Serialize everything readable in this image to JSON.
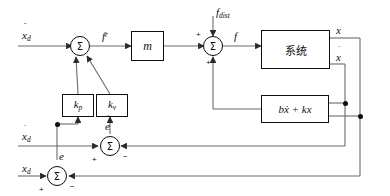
{
  "diagram": {
    "canvas": {
      "width": 390,
      "height": 196
    },
    "line_color": "#4a4a4a",
    "stroke_color": "#0d0d0d",
    "background": "#ffffff"
  },
  "inputs": {
    "accel_ref": {
      "base": "x",
      "accent": "¨",
      "sub": "d",
      "text": "ẍd"
    },
    "vel_ref": {
      "base": "x",
      "accent": "˙",
      "sub": "d",
      "text": "ẋd"
    },
    "pos_ref": {
      "base": "x",
      "sub": "d",
      "text": "xd"
    },
    "disturbance": {
      "base": "f",
      "sub": "dist",
      "text": "fdist"
    }
  },
  "signals": {
    "command_force": {
      "base": "f",
      "sup": "r",
      "text": "f r"
    },
    "total_force": {
      "base": "f",
      "text": "f"
    },
    "position_out": {
      "base": "x",
      "text": "x"
    },
    "velocity_out": {
      "base": "x",
      "accent": "˙",
      "text": "ẋ"
    },
    "pos_error": {
      "base": "e",
      "text": "e"
    },
    "vel_error": {
      "base": "e",
      "accent": "˙",
      "text": "ė"
    }
  },
  "blocks": {
    "mass": {
      "label": "m",
      "name": "mass-gain-block"
    },
    "gain_p": {
      "base": "k",
      "sub": "p",
      "text": "kp",
      "name": "proportional-gain-block"
    },
    "gain_v": {
      "base": "k",
      "sub": "v",
      "text": "kv",
      "name": "derivative-gain-block"
    },
    "plant": {
      "label": "系统",
      "name": "plant-block"
    },
    "dynamics": {
      "label": "bẋ + kx",
      "name": "dynamics-feedback-block"
    }
  },
  "summers": {
    "force_sum": {
      "symbol": "Σ",
      "signs": [
        "+",
        "+",
        "+"
      ],
      "name": "force-summing-junction"
    },
    "plant_sum": {
      "symbol": "Σ",
      "signs": [
        "+",
        "+",
        "+"
      ],
      "name": "plant-input-summing-junction"
    },
    "vel_error_sum": {
      "symbol": "Σ",
      "signs": [
        "+",
        "−"
      ],
      "name": "velocity-error-summing-junction"
    },
    "pos_error_sum": {
      "symbol": "Σ",
      "signs": [
        "+",
        "−"
      ],
      "name": "position-error-summing-junction"
    }
  },
  "signs": {
    "plus": "+",
    "minus": "−"
  }
}
